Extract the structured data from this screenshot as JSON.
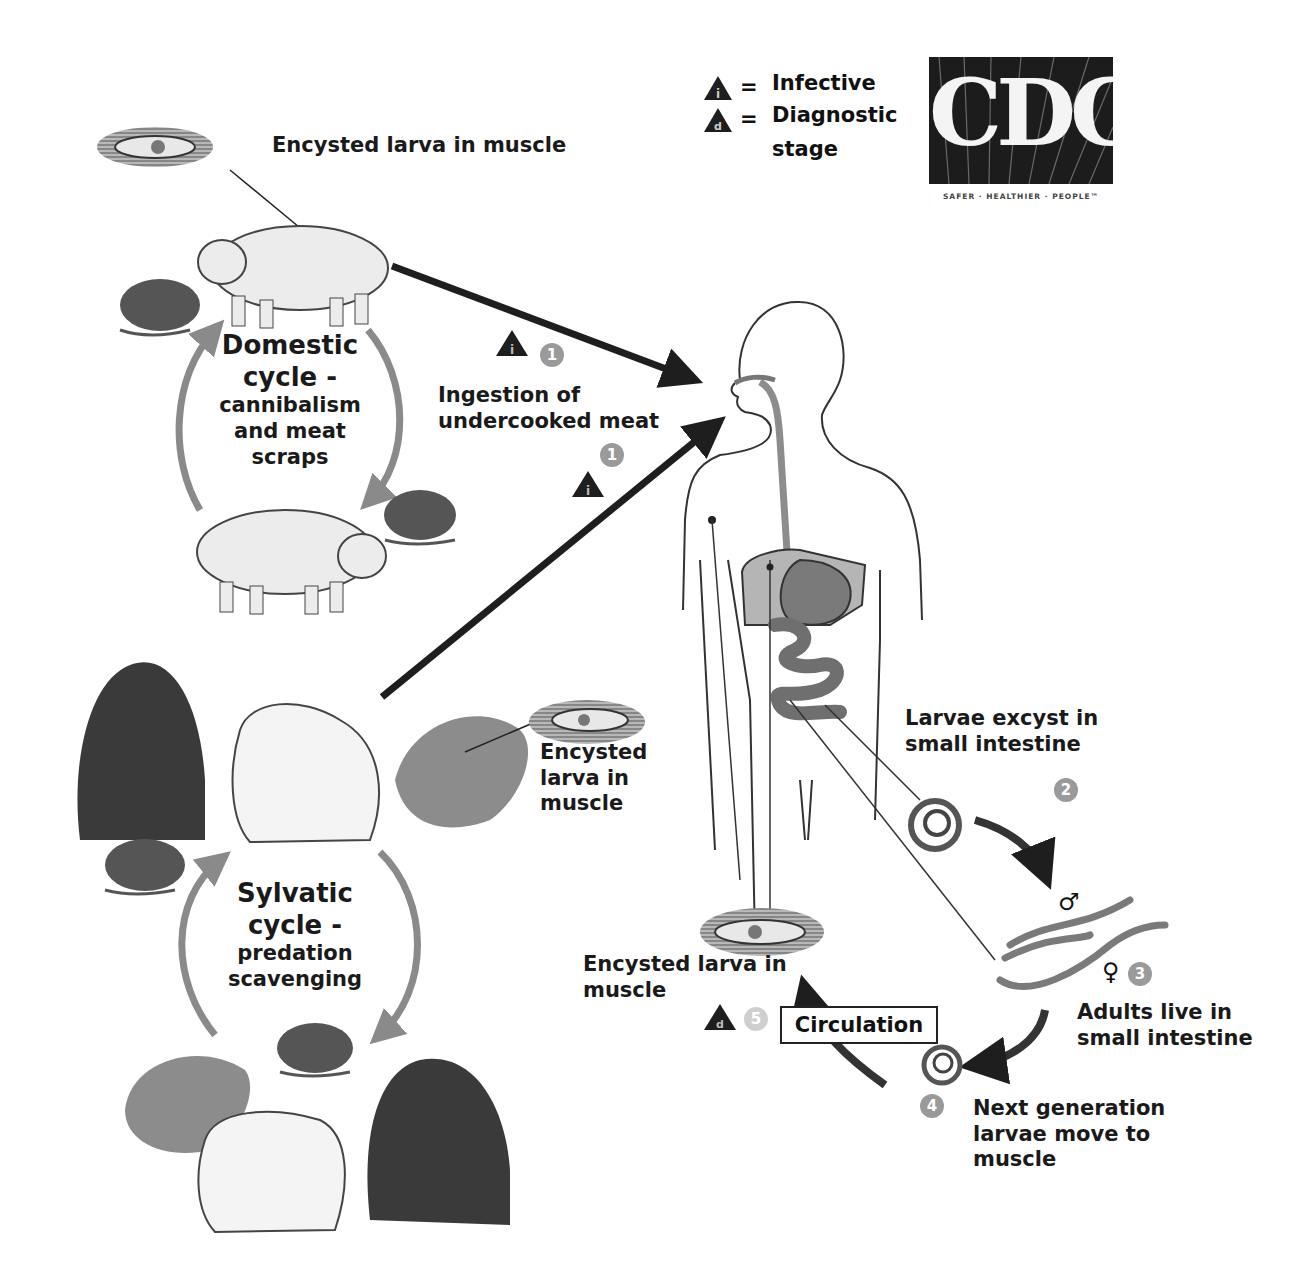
{
  "legend": {
    "infective_symbol": "i",
    "infective_label": "Infective",
    "diagnostic_symbol": "d",
    "diagnostic_label_line1": "Diagnostic",
    "diagnostic_label_line2": "stage",
    "equals": "="
  },
  "logo": {
    "text": "CDC",
    "tagline": "SAFER · HEALTHIER · PEOPLE™"
  },
  "domestic": {
    "encysted_label": "Encysted larva in muscle",
    "cycle_lines": [
      "Domestic",
      "cycle -",
      "cannibalism",
      "and meat",
      "scraps"
    ]
  },
  "ingestion": {
    "label_line1": "Ingestion of",
    "label_line2": "undercooked meat",
    "step": "1"
  },
  "sylvatic": {
    "encysted_lines": [
      "Encysted",
      "larva in",
      "muscle"
    ],
    "cycle_lines": [
      "Sylvatic",
      "cycle -",
      "predation",
      "scavenging"
    ]
  },
  "stages": {
    "step2": {
      "number": "2",
      "lines": [
        "Larvae excyst in",
        "small intestine"
      ]
    },
    "step3": {
      "number": "3",
      "lines": [
        "Adults live in",
        "small intestine"
      ],
      "male_symbol": "♂",
      "female_symbol": "♀"
    },
    "step4": {
      "number": "4",
      "lines": [
        "Next generation",
        "larvae move to",
        "muscle"
      ]
    },
    "step5": {
      "number": "5",
      "lines": [
        "Encysted larva in",
        "muscle"
      ]
    },
    "circulation_label": "Circulation"
  },
  "colors": {
    "arrow_dark": "#1e1e1e",
    "arrow_gray": "#8a8a8a",
    "organ_gray": "#8c8c8c",
    "logo_bg": "#1c1c1c"
  }
}
